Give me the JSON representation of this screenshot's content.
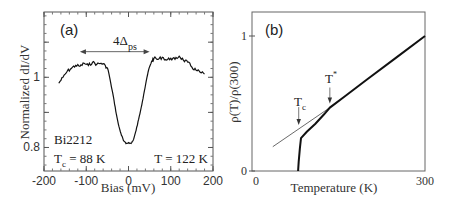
{
  "chart_data": [
    {
      "panel_label": "(a)",
      "type": "line",
      "xlabel": "Bias (mV)",
      "ylabel": "Normalized dI/dV",
      "xlim": [
        -200,
        200
      ],
      "ylim": [
        0.733,
        1.186
      ],
      "xticks": [
        -200,
        -100,
        0,
        100,
        200
      ],
      "xtick_labels": [
        "-200",
        "-100",
        "0",
        "100",
        "200"
      ],
      "yticks": [
        0.8,
        1.0
      ],
      "ytick_labels": [
        "0.8",
        "1"
      ],
      "grid": false,
      "series": [
        {
          "name": "dI/dV at T = 122 K",
          "x": [
            -165,
            -155,
            -145,
            -135,
            -125,
            -115,
            -105,
            -95,
            -85,
            -75,
            -65,
            -55,
            -48,
            -42,
            -36,
            -30,
            -24,
            -18,
            -12,
            -6,
            0,
            6,
            12,
            18,
            24,
            30,
            36,
            42,
            48,
            55,
            60,
            70,
            80,
            90,
            100,
            110,
            120,
            130,
            140,
            150,
            160,
            170,
            180
          ],
          "y": [
            0.983,
            1.0,
            1.017,
            1.026,
            1.034,
            1.031,
            1.04,
            1.034,
            1.043,
            1.037,
            1.04,
            1.034,
            1.02,
            0.983,
            0.946,
            0.903,
            0.866,
            0.84,
            0.82,
            0.811,
            0.814,
            0.811,
            0.823,
            0.849,
            0.88,
            0.914,
            0.951,
            0.989,
            1.023,
            1.046,
            1.054,
            1.051,
            1.057,
            1.049,
            1.054,
            1.051,
            1.06,
            1.049,
            1.043,
            1.029,
            1.02,
            1.014,
            1.009
          ]
        }
      ],
      "annotations": [
        {
          "text": "4Δ",
          "subscript": "ps",
          "type": "double-arrow",
          "x_from": -115,
          "x_to": 50,
          "y": 1.073
        },
        {
          "text": "Bi2212"
        },
        {
          "text": "T",
          "subscript": "c",
          "suffix": " = 88 K"
        },
        {
          "text": "T = 122 K"
        }
      ]
    },
    {
      "panel_label": "(b)",
      "type": "line",
      "xlabel": "Temperature (K)",
      "ylabel": "ρ(T)/ρ(300)",
      "xlim": [
        0,
        300
      ],
      "ylim": [
        0,
        1.2
      ],
      "xticks": [
        0,
        300
      ],
      "xtick_labels": [
        "0",
        "300"
      ],
      "yticks": [
        0,
        1
      ],
      "ytick_labels": [
        "0",
        "1"
      ],
      "grid": false,
      "series": [
        {
          "name": "resistivity",
          "x": [
            80,
            81,
            83,
            85,
            95,
            110,
            125,
            135,
            160,
            200,
            250,
            300
          ],
          "y": [
            0,
            0.07,
            0.17,
            0.244,
            0.29,
            0.35,
            0.42,
            0.47,
            0.55,
            0.68,
            0.84,
            1.0
          ]
        },
        {
          "name": "linear extrapolation",
          "x": [
            36,
            135
          ],
          "y": [
            0.18,
            0.47
          ]
        }
      ],
      "annotations": [
        {
          "text": "T",
          "subscript": "c",
          "arrow_to_x": 81,
          "arrow_to_y": 0.34
        },
        {
          "text": "T",
          "superscript": "*",
          "arrow_to_x": 135,
          "arrow_to_y": 0.5
        }
      ]
    }
  ]
}
